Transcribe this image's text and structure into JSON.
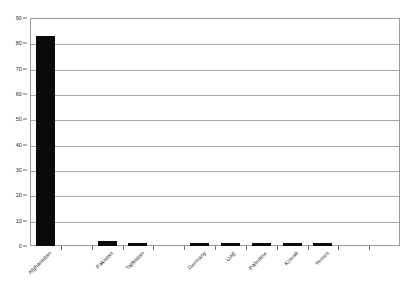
{
  "chart_data": {
    "type": "bar",
    "title": "",
    "subtitle": "",
    "xlabel": "",
    "ylabel": "",
    "categories": [
      "Afghanistan",
      "Pakistan",
      "Tajikistan",
      "Germany",
      "UAE",
      "Palestine",
      "Kuwait",
      "Yemen"
    ],
    "values": [
      83,
      2,
      1,
      1,
      1,
      1,
      1,
      1
    ],
    "ylim": [
      0,
      90
    ],
    "ytick_labels": [
      "0",
      "10",
      "20",
      "30",
      "40",
      "50",
      "60",
      "70",
      "80",
      "90"
    ],
    "ytick_values": [
      0,
      10,
      20,
      30,
      40,
      50,
      60,
      70,
      80,
      90
    ],
    "y_tick_step": 10,
    "grid": "horizontal",
    "legend": "none",
    "bar_color": "#0a0a0a",
    "grid_color": "#a8a8a8",
    "frame_color": "#9a9a9a",
    "background_color": "#ffffff",
    "xtick_label_rotation": -45,
    "bar_slots": 12,
    "bar_slot_indices": [
      0,
      2,
      3,
      5,
      6,
      7,
      8,
      9,
      10
    ]
  }
}
